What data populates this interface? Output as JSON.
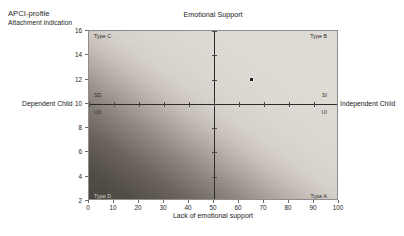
{
  "header": {
    "line1": "APCI-profile",
    "line2": "Attachment indication"
  },
  "chart_data": {
    "type": "scatter",
    "title": "Emotional Support",
    "xlabel": "Lack of emotional support",
    "ylabel": "",
    "xlim": [
      0,
      100
    ],
    "ylim": [
      2,
      16
    ],
    "xticks": [
      "0",
      "10",
      "20",
      "30",
      "40",
      "50",
      "60",
      "70",
      "80",
      "90",
      "100"
    ],
    "xtick_values": [
      0,
      10,
      20,
      30,
      40,
      50,
      60,
      70,
      80,
      90,
      100
    ],
    "yticks": [
      "16",
      "14",
      "12",
      "10",
      "8",
      "6",
      "4",
      "2"
    ],
    "ytick_values": [
      16,
      14,
      12,
      10,
      8,
      6,
      4,
      2
    ],
    "grid": false,
    "legend": "none",
    "points": [
      {
        "x": 65,
        "y": 12,
        "label": ""
      }
    ],
    "reference_lines": [
      {
        "orientation": "vertical",
        "value": 50
      },
      {
        "orientation": "horizontal",
        "value": 10
      }
    ],
    "background": "diagonal gradient, dark at bottom-left to light at top-right",
    "quadrant_labels": [
      {
        "name": "Type C",
        "position": "top-left",
        "x": 2,
        "y": 15.6
      },
      {
        "name": "Type B",
        "position": "top-right",
        "x": 96,
        "y": 15.6
      },
      {
        "name": "Type D",
        "position": "bottom-left",
        "x": 2,
        "y": 2.4
      },
      {
        "name": "Type A",
        "position": "bottom-right",
        "x": 96,
        "y": 2.4
      }
    ],
    "axis_zone_labels": [
      {
        "name": "SD",
        "position": "left-above-axis",
        "x": 2,
        "y": 10.7
      },
      {
        "name": "UD",
        "position": "left-below-axis",
        "x": 2,
        "y": 9.3
      },
      {
        "name": "SI",
        "position": "right-above-axis",
        "x": 96,
        "y": 10.7
      },
      {
        "name": "UI",
        "position": "right-below-axis",
        "x": 96,
        "y": 9.3
      }
    ]
  },
  "side_labels": {
    "left": "Dependent Child",
    "right": "Independent Child"
  },
  "colors": {
    "gradient_dark": "#4a443f",
    "gradient_light": "#e0dcd6",
    "axis": "#2a2a2a",
    "frame": "#8d8d8d",
    "point": "#1a1a1a",
    "text": "#1d1d1d",
    "page_background": "#ffffff"
  }
}
